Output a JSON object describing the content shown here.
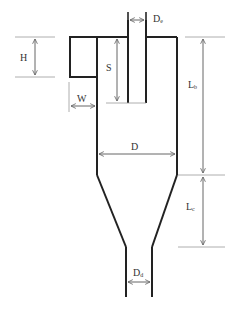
{
  "diagram": {
    "type": "cyclone-separator-dimensions",
    "colors": {
      "body_stroke": "#222222",
      "dimension_stroke": "#666666",
      "guide_stroke": "#999999",
      "label": "#333333"
    },
    "labels": {
      "H": {
        "main": "H",
        "sub": ""
      },
      "S": {
        "main": "S",
        "sub": ""
      },
      "W": {
        "main": "W",
        "sub": ""
      },
      "De": {
        "main": "D",
        "sub": "e"
      },
      "D": {
        "main": "D",
        "sub": ""
      },
      "Lb": {
        "main": "L",
        "sub": "b"
      },
      "Lc": {
        "main": "L",
        "sub": "c"
      },
      "Dd": {
        "main": "D",
        "sub": "d"
      }
    }
  }
}
